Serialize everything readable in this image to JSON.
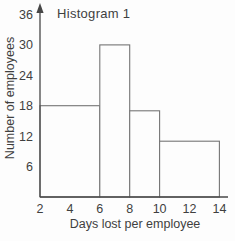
{
  "figure": {
    "title": "Histogram 1",
    "x_axis_label": "Days lost per employee",
    "y_axis_label": "Number of employees"
  },
  "chart_data": {
    "type": "bar",
    "subtype": "histogram",
    "title": "Histogram 1",
    "xlabel": "Days lost per employee",
    "ylabel": "Number of employees",
    "bins": [
      {
        "range": [
          2,
          6
        ],
        "count": 18
      },
      {
        "range": [
          6,
          8
        ],
        "count": 30
      },
      {
        "range": [
          8,
          10
        ],
        "count": 17
      },
      {
        "range": [
          10,
          14
        ],
        "count": 11
      }
    ],
    "x_ticks": [
      2,
      4,
      6,
      8,
      10,
      12,
      14
    ],
    "y_ticks": [
      6,
      12,
      18,
      24,
      30,
      36
    ],
    "xlim": [
      2,
      14
    ],
    "ylim": [
      0,
      36
    ],
    "grid": false,
    "legend": false,
    "colors": {
      "axis_line": "#474747",
      "bar_stroke": "#757575",
      "bar_fill": "#fdfdfd",
      "text": "#3f3f3f",
      "background": "#fdfdfd"
    }
  }
}
